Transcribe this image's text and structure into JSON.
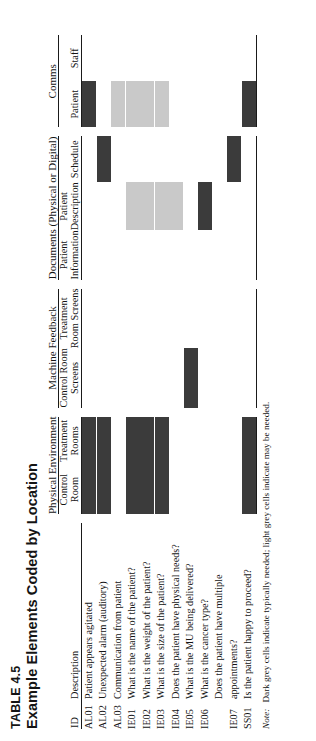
{
  "table": {
    "number": "TABLE 4.5",
    "title": "Example Elements Coded by Location",
    "note_label": "Note:",
    "note_text": "Dark grey cells indicate typically needed; light grey cells indicate may be needed."
  },
  "colors": {
    "dark": "#3b3b3b",
    "light": "#c9c9c9",
    "rule": "#1a1a1a",
    "text": "#141414"
  },
  "headers": {
    "id": "ID",
    "description": "Description",
    "groups": [
      {
        "label": "Physical Environment",
        "span": 2
      },
      {
        "label": "Machine Feedback",
        "span": 2
      },
      {
        "label": "Documents (Physical or Digital)",
        "span": 3
      },
      {
        "label": "Comms",
        "span": 2
      }
    ],
    "columns": [
      "Control Room",
      "Treatment Rooms",
      "Control Room Screens",
      "Treatment Room Screens",
      "Patient Information",
      "Patient Description",
      "Schedule",
      "Patient",
      "Staff"
    ],
    "columns_wrapped": [
      [
        "Control",
        "Room"
      ],
      [
        "Treatment",
        "Rooms"
      ],
      [
        "Control Room",
        "Screens"
      ],
      [
        "Treatment",
        "Room Screens"
      ],
      [
        "Patient",
        "Information"
      ],
      [
        "Patient",
        "Description"
      ],
      [
        "Schedule",
        ""
      ],
      [
        "Patient",
        ""
      ],
      [
        "Staff",
        ""
      ]
    ]
  },
  "rows": [
    {
      "id": "AL01",
      "description": "Patient appears agitated",
      "cells": [
        "dark",
        "dark",
        "none",
        "none",
        "none",
        "none",
        "none",
        "dark",
        "none"
      ]
    },
    {
      "id": "AL02",
      "description": "Unexpected alarm (auditory)",
      "cells": [
        "dark",
        "dark",
        "none",
        "none",
        "none",
        "none",
        "dark",
        "none",
        "none"
      ]
    },
    {
      "id": "AL03",
      "description": "Communication from patient",
      "cells": [
        "none",
        "none",
        "none",
        "none",
        "none",
        "none",
        "none",
        "light",
        "none"
      ]
    },
    {
      "id": "IE01",
      "description": "What is the name of the patient?",
      "cells": [
        "dark",
        "dark",
        "none",
        "none",
        "none",
        "light",
        "none",
        "light",
        "none"
      ]
    },
    {
      "id": "IE02",
      "description": "What is the weight of the patient?",
      "cells": [
        "dark",
        "dark",
        "none",
        "none",
        "none",
        "light",
        "none",
        "light",
        "none"
      ]
    },
    {
      "id": "IE03",
      "description": "What is the size of the patient?",
      "cells": [
        "dark",
        "dark",
        "none",
        "none",
        "none",
        "light",
        "none",
        "light",
        "none"
      ]
    },
    {
      "id": "IE04",
      "description": "Does the patient have physical needs?",
      "cells": [
        "none",
        "none",
        "none",
        "none",
        "none",
        "light",
        "none",
        "none",
        "none"
      ]
    },
    {
      "id": "IE05",
      "description": "What is the MU being delivered?",
      "cells": [
        "none",
        "none",
        "dark",
        "none",
        "none",
        "none",
        "none",
        "none",
        "none"
      ]
    },
    {
      "id": "IE06",
      "description": "What is the cancer type?",
      "cells": [
        "none",
        "none",
        "none",
        "none",
        "none",
        "dark",
        "none",
        "none",
        "none"
      ]
    },
    {
      "id": "IE07",
      "description": "Does the patient have multiple appointments?",
      "description_l1": "Does the patient have multiple",
      "description_l2": "appointments?",
      "cells": [
        "none",
        "none",
        "none",
        "none",
        "none",
        "none",
        "dark",
        "none",
        "none"
      ]
    },
    {
      "id": "SS01",
      "description": "Is the patient happy to proceed?",
      "cells": [
        "dark",
        "dark",
        "none",
        "none",
        "none",
        "none",
        "none",
        "dark",
        "none"
      ]
    }
  ]
}
